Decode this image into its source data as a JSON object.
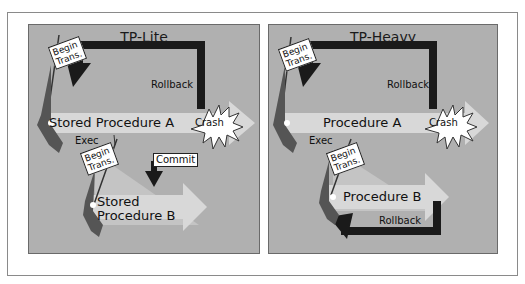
{
  "colors": {
    "panel_bg": "#b0b0b0",
    "arrow_light": "#d8d8d8",
    "arrow_dark": "#1a1a1a",
    "flag_pole": "#5a5a5a"
  },
  "left_panel": {
    "title": "TP-Lite",
    "flag_a": {
      "line1": "Begin",
      "line2": "Trans."
    },
    "rollback": "Rollback",
    "proc_a": "Stored Procedure A",
    "crash": "Crash",
    "exec": "Exec",
    "flag_b": {
      "line1": "Begin",
      "line2": "Trans."
    },
    "commit": "Commit",
    "proc_b_line1": "Stored",
    "proc_b_line2": "Procedure B"
  },
  "right_panel": {
    "title": "TP-Heavy",
    "flag_a": {
      "line1": "Begin",
      "line2": "Trans."
    },
    "rollback_a": "Rollback",
    "proc_a": "Procedure A",
    "crash": "Crash",
    "exec": "Exec",
    "flag_b": {
      "line1": "Begin",
      "line2": "Trans."
    },
    "proc_b": "Procedure B",
    "rollback_b": "Rollback"
  }
}
